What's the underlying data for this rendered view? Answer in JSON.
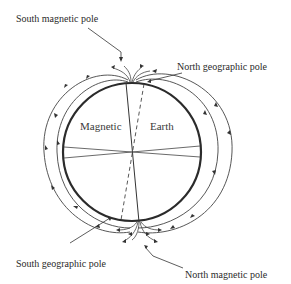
{
  "diagram": {
    "labels": {
      "south_magnetic_pole": "South magnetic pole",
      "north_geographic_pole": "North geographic pole",
      "south_geographic_pole": "South geographic pole",
      "north_magnetic_pole": "North magnetic pole",
      "left_center": "Magnetic",
      "right_center": "Earth"
    },
    "colors": {
      "stroke": "#333333",
      "earth_outline": "#2b2b2b",
      "background": "#ffffff"
    }
  }
}
